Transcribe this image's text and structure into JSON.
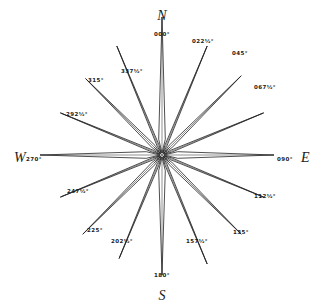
{
  "diagram": {
    "center": [
      162,
      155
    ],
    "colors": {
      "line": "#222222",
      "fill": "#ffffff",
      "text": "#1a1a1a",
      "background": "#ffffff"
    },
    "cardinals": [
      {
        "letter": "N",
        "x": 162,
        "y": 20,
        "anchor": "middle"
      },
      {
        "letter": "E",
        "x": 301,
        "y": 162,
        "anchor": "start"
      },
      {
        "letter": "S",
        "x": 162,
        "y": 300,
        "anchor": "middle"
      },
      {
        "letter": "W",
        "x": 14,
        "y": 162,
        "anchor": "start"
      }
    ],
    "points": [
      {
        "bearing": 0,
        "label": "000°",
        "len": 138,
        "lx": 162,
        "ly": 36,
        "anchor": "middle"
      },
      {
        "bearing": 22.5,
        "label": "022½°",
        "len": 118,
        "lx": 203,
        "ly": 43,
        "anchor": "middle"
      },
      {
        "bearing": 45,
        "label": "045°",
        "len": 112,
        "lx": 240,
        "ly": 55,
        "anchor": "middle"
      },
      {
        "bearing": 67.5,
        "label": "067½°",
        "len": 110,
        "lx": 265,
        "ly": 89,
        "anchor": "middle"
      },
      {
        "bearing": 90,
        "label": "090°",
        "len": 112,
        "lx": 285,
        "ly": 161,
        "anchor": "middle"
      },
      {
        "bearing": 112.5,
        "label": "112½°",
        "len": 110,
        "lx": 265,
        "ly": 198,
        "anchor": "middle"
      },
      {
        "bearing": 135,
        "label": "135°",
        "len": 112,
        "lx": 241,
        "ly": 234,
        "anchor": "middle"
      },
      {
        "bearing": 157.5,
        "label": "157½°",
        "len": 118,
        "lx": 197,
        "ly": 243,
        "anchor": "middle"
      },
      {
        "bearing": 180,
        "label": "180°",
        "len": 120,
        "lx": 162,
        "ly": 277,
        "anchor": "middle"
      },
      {
        "bearing": 202.5,
        "label": "202½°",
        "len": 112,
        "lx": 122,
        "ly": 243,
        "anchor": "middle"
      },
      {
        "bearing": 225,
        "label": "225°",
        "len": 112,
        "lx": 95,
        "ly": 232,
        "anchor": "middle"
      },
      {
        "bearing": 247.5,
        "label": "247½°",
        "len": 110,
        "lx": 78,
        "ly": 193,
        "anchor": "middle"
      },
      {
        "bearing": 270,
        "label": "270°",
        "len": 122,
        "lx": 26,
        "ly": 161,
        "anchor": "start"
      },
      {
        "bearing": 292.5,
        "label": "292½°",
        "len": 110,
        "lx": 77,
        "ly": 116,
        "anchor": "middle"
      },
      {
        "bearing": 315,
        "label": "315°",
        "len": 108,
        "lx": 96,
        "ly": 82,
        "anchor": "middle"
      },
      {
        "bearing": 337.5,
        "label": "337½°",
        "len": 118,
        "lx": 132,
        "ly": 73,
        "anchor": "middle"
      }
    ]
  }
}
